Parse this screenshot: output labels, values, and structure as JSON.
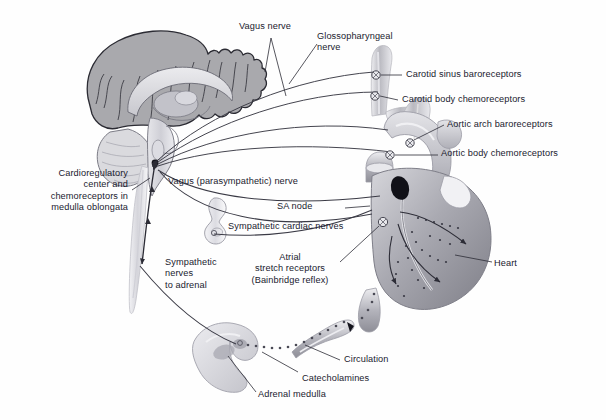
{
  "figure": {
    "type": "anatomical-diagram",
    "background_color": "#fefefe",
    "ink_color": "#1a1a2e"
  },
  "labels": {
    "vagus_nerve": "Vagus nerve",
    "glossopharyngeal_nerve": "Glossopharyngeal\nnerve",
    "carotid_sinus_baroreceptors": "Carotid sinus baroreceptors",
    "carotid_body_chemoreceptors": "Carotid body chemoreceptors",
    "aortic_arch_baroreceptors": "Aortic arch baroreceptors",
    "aortic_body_chemoreceptors": "Aortic body chemoreceptors",
    "cardioregulatory_center": "Cardioregulatory\ncenter and\nchemoreceptors in\nmedulla oblongata",
    "vagus_parasympathetic_nerve": "Vagus (parasympathetic) nerve",
    "sa_node": "SA node",
    "sympathetic_cardiac_nerves": "Sympathetic cardiac nerves",
    "atrial_stretch_receptors": "Atrial\nstretch receptors\n(Bainbridge reflex)",
    "heart": "Heart",
    "sympathetic_nerves_to_adrenal": "Sympathetic\nnerves\nto adrenal",
    "circulation": "Circulation",
    "catecholamines": "Catecholamines",
    "adrenal_medulla": "Adrenal medulla"
  },
  "structures": {
    "brain": "mid-sagittal-brain",
    "cerebellum": "cerebellum",
    "brainstem": "brainstem-medulla",
    "spinal_cord": "spinal-cord",
    "sympathetic_ganglion": "sympathetic-chain-ganglion",
    "heart": "heart-with-great-vessels",
    "aortic_arch": "aortic-arch",
    "carotid_arteries": "carotid-arteries",
    "adrenal_gland": "adrenal-gland",
    "blood_vessel": "blood-vessel-circulation",
    "sa_node_marker": "sa-node-dark-oval"
  },
  "palette": {
    "cortex_gray": "#a9a9ad",
    "cortex_edge": "#2b2b33",
    "interior_light": "#d9d9dd",
    "tissue_light": "#c9c9ce",
    "tissue_mid": "#9a9aa0",
    "tissue_dark": "#6e6e76",
    "sa_node": "#111118",
    "line": "#33333d"
  }
}
